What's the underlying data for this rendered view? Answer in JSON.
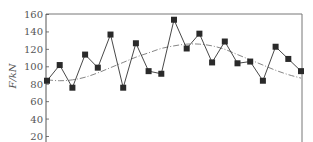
{
  "chart_data": {
    "type": "line",
    "title": "",
    "xlabel": "",
    "ylabel": "F/kN",
    "ylim": [
      20,
      160
    ],
    "yticks": [
      20,
      40,
      60,
      80,
      100,
      120,
      140,
      160
    ],
    "grid": false,
    "legend": null,
    "x": [
      1,
      2,
      3,
      4,
      5,
      6,
      7,
      8,
      9,
      10,
      11,
      12,
      13,
      14,
      15,
      16,
      17,
      18,
      19,
      20,
      21
    ],
    "series": [
      {
        "name": "measured",
        "style": "solid line with square markers",
        "color": "#333333",
        "values": [
          84,
          102,
          76,
          114,
          99,
          137,
          76,
          127,
          95,
          92,
          154,
          121,
          138,
          105,
          129,
          104,
          106,
          84,
          123,
          109,
          95
        ]
      },
      {
        "name": "trend",
        "style": "dash-dot curve",
        "color": "#777777",
        "values": [
          85,
          84,
          85,
          88,
          93,
          99,
          105,
          111,
          116,
          121,
          124,
          126,
          126,
          124,
          120,
          114,
          108,
          102,
          96,
          91,
          87
        ]
      }
    ]
  },
  "axis": {
    "y_title": "F/kN",
    "y_tick_labels": [
      "160",
      "140",
      "120",
      "100",
      "80",
      "60",
      "40",
      "20"
    ]
  }
}
